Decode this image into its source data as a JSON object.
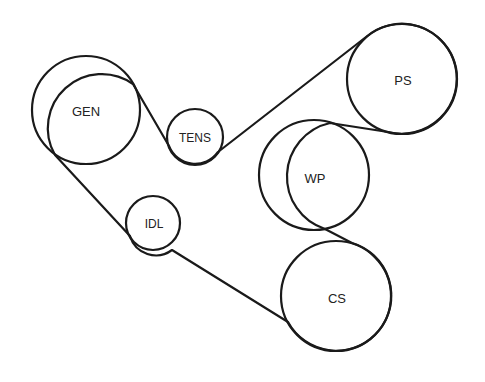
{
  "diagram": {
    "title": "",
    "colors": {
      "stroke": "#1a1a1a",
      "label": "#222222",
      "background": "#ffffff"
    },
    "pulleys": [
      {
        "id": "gen",
        "label": "GEN",
        "cx": 86,
        "cy": 110,
        "r": 54
      },
      {
        "id": "tens",
        "label": "TENS",
        "cx": 195,
        "cy": 137,
        "r": 28
      },
      {
        "id": "ps",
        "label": "PS",
        "cx": 402,
        "cy": 79,
        "r": 55
      },
      {
        "id": "wp",
        "label": "WP",
        "cx": 314,
        "cy": 175,
        "r": 55
      },
      {
        "id": "idl",
        "label": "IDL",
        "cx": 153,
        "cy": 223,
        "r": 27
      },
      {
        "id": "cs",
        "label": "CS",
        "cx": 336,
        "cy": 296,
        "r": 55
      }
    ],
    "belt_route": [
      "GEN",
      "TENS",
      "PS",
      "WP",
      "CS",
      "IDL",
      "GEN"
    ]
  }
}
